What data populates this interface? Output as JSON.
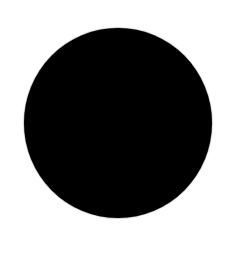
{
  "canvas": {
    "width": 237,
    "height": 258,
    "background": "#ffffff"
  },
  "shape": {
    "type": "circle",
    "fill": "#000000",
    "center": [
      118,
      123
    ],
    "diameter_x": 188,
    "diameter_y": 190
  }
}
